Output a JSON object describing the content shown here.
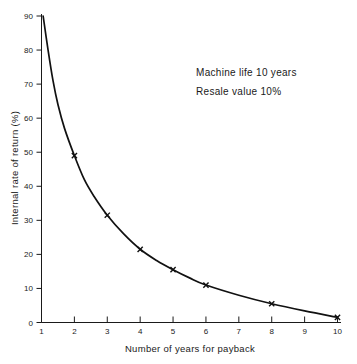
{
  "chart_data": {
    "type": "line",
    "title": "",
    "xlabel": "Number of years for payback",
    "ylabel": "Internal rate of return (%)",
    "xlim": [
      1,
      10
    ],
    "ylim": [
      0,
      90
    ],
    "grid": false,
    "legend": null,
    "x_ticks": [
      "1",
      "2",
      "3",
      "4",
      "5",
      "6",
      "7",
      "8",
      "9",
      "10"
    ],
    "x_tick_values": [
      1,
      2,
      3,
      4,
      5,
      6,
      7,
      8,
      9,
      10
    ],
    "y_ticks": [
      "0",
      "10",
      "20",
      "30",
      "40",
      "50",
      "60",
      "70",
      "80",
      "90"
    ],
    "y_tick_values": [
      0,
      10,
      20,
      30,
      40,
      50,
      60,
      70,
      80,
      90
    ],
    "marker_style": "x",
    "series": [
      {
        "name": "Internal rate of return",
        "x": [
          2,
          3,
          4,
          5,
          6,
          8,
          10
        ],
        "values": [
          49,
          31.5,
          21.5,
          15.5,
          11,
          5.5,
          1.5
        ]
      }
    ],
    "curve_points": [
      {
        "x": 1.05,
        "y": 90
      },
      {
        "x": 1.2,
        "y": 80
      },
      {
        "x": 1.35,
        "y": 71
      },
      {
        "x": 1.5,
        "y": 64
      },
      {
        "x": 1.7,
        "y": 57
      },
      {
        "x": 2.0,
        "y": 49
      },
      {
        "x": 2.3,
        "y": 42
      },
      {
        "x": 2.6,
        "y": 37
      },
      {
        "x": 3.0,
        "y": 31.5
      },
      {
        "x": 3.5,
        "y": 26
      },
      {
        "x": 4.0,
        "y": 21.5
      },
      {
        "x": 4.5,
        "y": 18.2
      },
      {
        "x": 5.0,
        "y": 15.5
      },
      {
        "x": 5.5,
        "y": 13.1
      },
      {
        "x": 6.0,
        "y": 11.0
      },
      {
        "x": 7.0,
        "y": 8.0
      },
      {
        "x": 8.0,
        "y": 5.5
      },
      {
        "x": 9.0,
        "y": 3.4
      },
      {
        "x": 10.0,
        "y": 1.5
      }
    ],
    "annotations": [
      "Machine life 10 years",
      "Resale value 10%"
    ]
  },
  "annotation_block": {
    "line1": "Machine life 10 years",
    "line2": "Resale value 10%"
  },
  "axes": {
    "x_title": "Number of years for payback",
    "y_title": "Internal rate of return (%)"
  },
  "colors": {
    "background": "#ffffff",
    "ink": "#1a1a1a",
    "curve": "#111111"
  }
}
